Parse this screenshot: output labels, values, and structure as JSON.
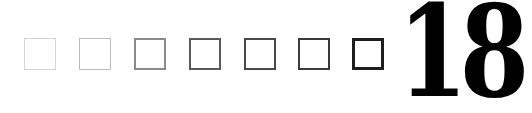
{
  "squares": [
    {
      "index": 1,
      "x": 24,
      "border_color": "#d4d4d4",
      "border_width": 1
    },
    {
      "index": 2,
      "x": 79,
      "border_color": "#bcbcbc",
      "border_width": 1
    },
    {
      "index": 3,
      "x": 134,
      "border_color": "#8a8a8a",
      "border_width": 2
    },
    {
      "index": 4,
      "x": 189,
      "border_color": "#5a5a5a",
      "border_width": 2
    },
    {
      "index": 5,
      "x": 244,
      "border_color": "#4a4a4a",
      "border_width": 2
    },
    {
      "index": 6,
      "x": 298,
      "border_color": "#3a3a3a",
      "border_width": 2
    },
    {
      "index": 7,
      "x": 352,
      "border_color": "#1e1e1e",
      "border_width": 3
    }
  ],
  "number": {
    "value": "18",
    "color": "#000000"
  }
}
